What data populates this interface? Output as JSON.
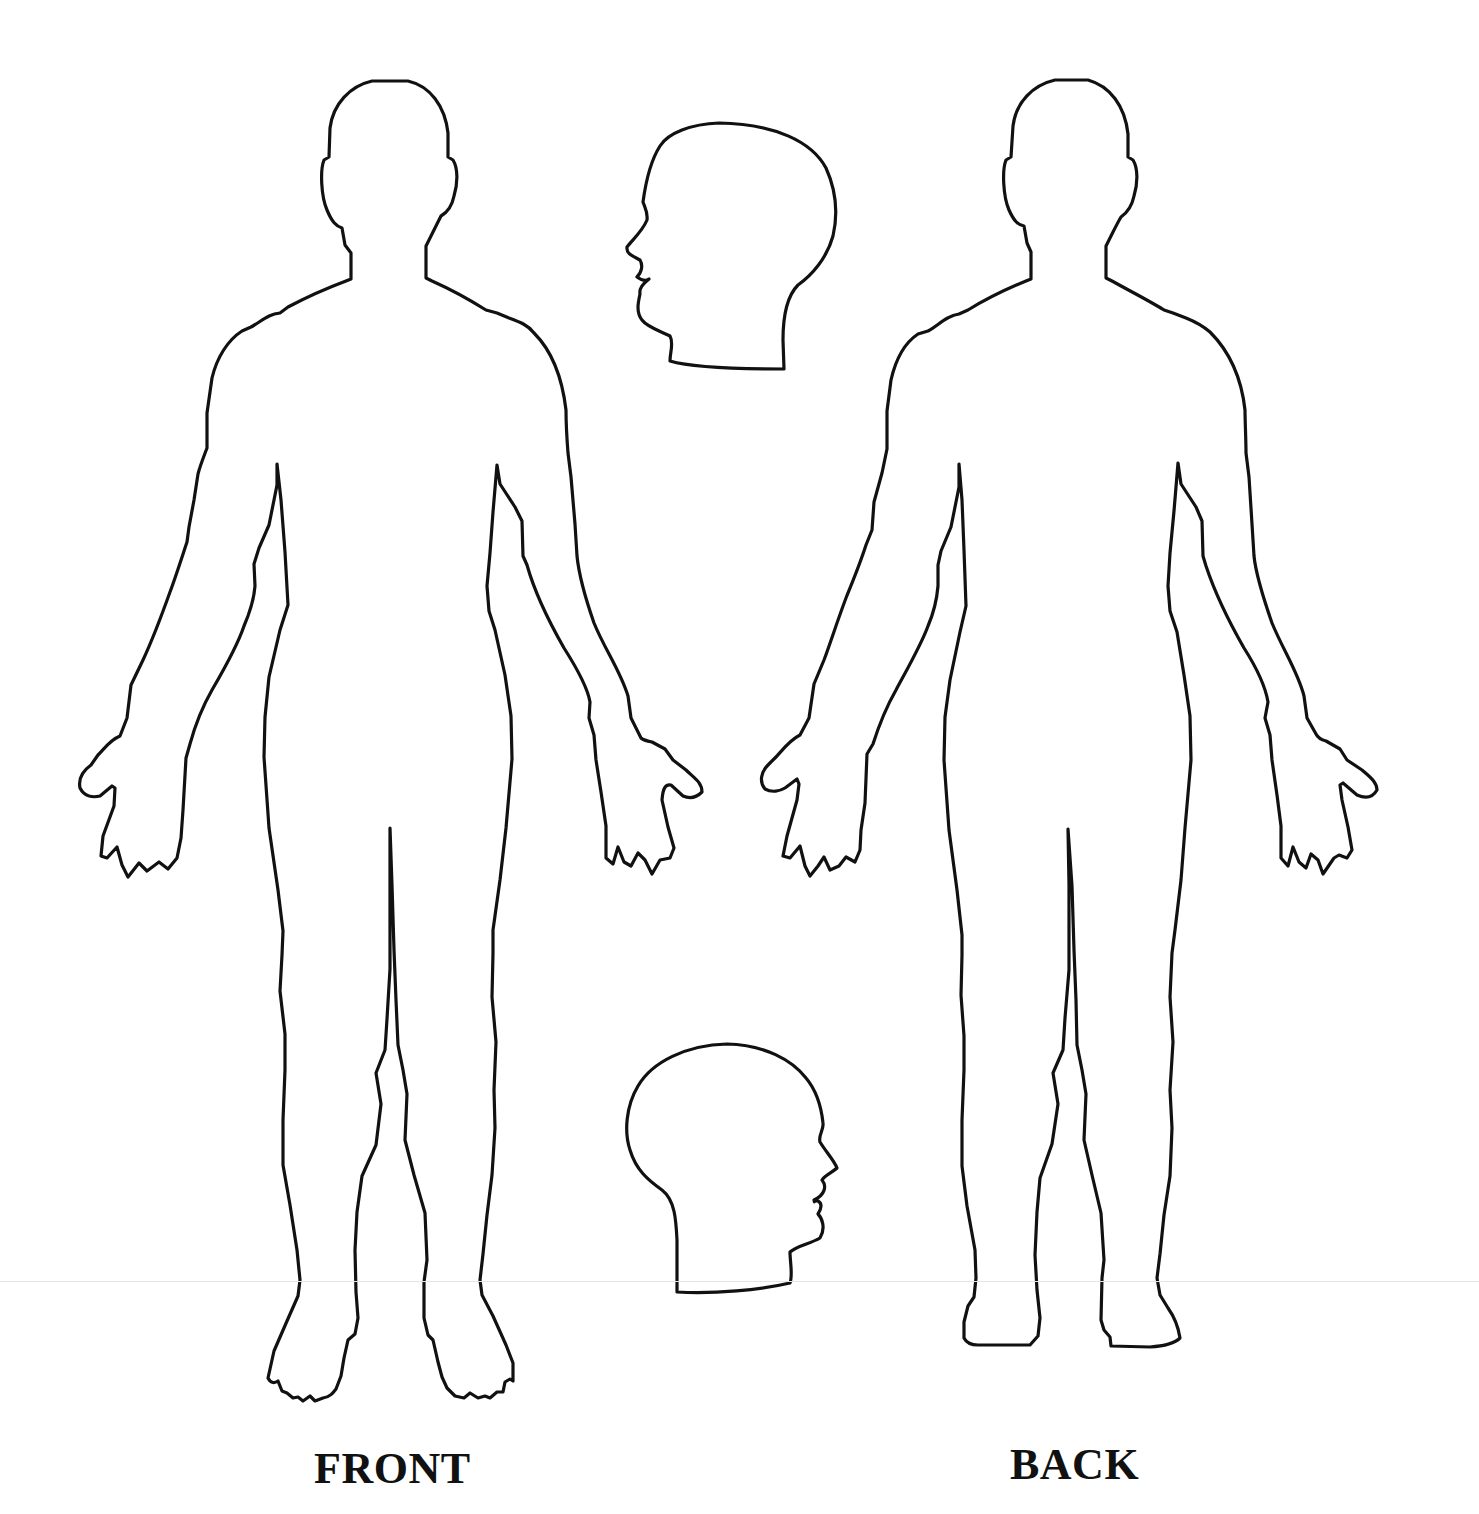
{
  "diagram": {
    "type": "body-chart",
    "background": "#ffffff",
    "stroke_color": "#111111",
    "figures": [
      {
        "id": "front",
        "label": "FRONT",
        "view": "anterior full body outline"
      },
      {
        "id": "back",
        "label": "BACK",
        "view": "posterior full body outline"
      }
    ],
    "heads": [
      {
        "id": "head-left-profile",
        "view": "head profile facing left"
      },
      {
        "id": "head-right-profile",
        "view": "head profile facing right"
      }
    ]
  },
  "labels": {
    "front": "FRONT",
    "back": "BACK"
  }
}
